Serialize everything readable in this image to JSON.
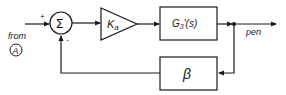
{
  "diagram": {
    "type": "block-diagram",
    "colors": {
      "stroke": "#1a1a1a",
      "background": "#ffffff"
    },
    "input": {
      "from_label": "from",
      "source_label": "A",
      "sign": "+"
    },
    "summing_junction": {
      "symbol": "Σ",
      "plus_sign": "+",
      "minus_sign": "-"
    },
    "gain": {
      "label_main": "K",
      "label_sub": "a"
    },
    "plant": {
      "label": "G",
      "label_sub": "3",
      "label_rest": "'(s)"
    },
    "feedback": {
      "label": "β"
    },
    "output": {
      "label": "pen"
    }
  }
}
